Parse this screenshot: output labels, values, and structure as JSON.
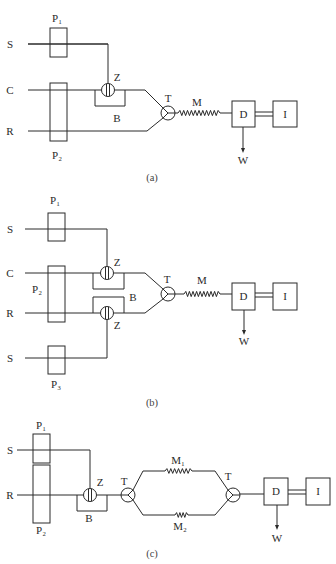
{
  "figure": {
    "colors": {
      "ink": "#2a2a2a",
      "background": "#ffffff"
    },
    "diagram_a": {
      "caption": "(a)",
      "inputs": {
        "s": "S",
        "c": "C",
        "r": "R"
      },
      "pumps": {
        "p1": "P₁",
        "p2": "P₂"
      },
      "valve": "Z",
      "bypass": "B",
      "tee": "T",
      "mixing_coil": "M",
      "detector": "D",
      "instrument": "I",
      "waste": "W"
    },
    "diagram_b": {
      "caption": "(b)",
      "inputs": {
        "s_top": "S",
        "c": "C",
        "r": "R",
        "s_bottom": "S"
      },
      "pumps": {
        "p1": "P₁",
        "p2": "P₂",
        "p3": "P₃"
      },
      "valve_top": "Z",
      "valve_bottom": "Z",
      "bypass": "B",
      "tee": "T",
      "mixing_coil": "M",
      "detector": "D",
      "instrument": "I",
      "waste": "W"
    },
    "diagram_c": {
      "caption": "(c)",
      "inputs": {
        "s": "S",
        "r": "R"
      },
      "pumps": {
        "p1": "P₁",
        "p2": "P₂"
      },
      "valve": "Z",
      "bypass": "B",
      "tee_split": "T",
      "tee_merge": "T",
      "mixing_coil_1": "M₁",
      "mixing_coil_2": "M₂",
      "detector": "D",
      "instrument": "I",
      "waste": "W"
    }
  }
}
